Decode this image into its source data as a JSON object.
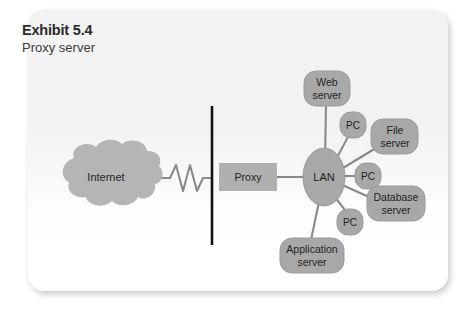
{
  "exhibit": {
    "title": "Exhibit 5.4",
    "subtitle": "Proxy server"
  },
  "colors": {
    "card_background": "#f2f2f2",
    "node_fill": "#a8a8a8",
    "node_stroke": "#8f8f8f",
    "cloud_fill": "#b5b5b5",
    "proxy_fill": "#b0b0b0",
    "connector": "#8a8a8a",
    "firewall": "#111111",
    "label_text": "#1f1f1f",
    "title_text": "#2b2b2b"
  },
  "diagram": {
    "type": "network-topology",
    "internet": {
      "label": "Internet",
      "shape": "cloud"
    },
    "firewall": {
      "label": "",
      "shape": "vertical-line"
    },
    "proxy": {
      "label": "Proxy",
      "shape": "rectangle"
    },
    "lan": {
      "label": "LAN",
      "shape": "ellipse"
    },
    "nodes": [
      {
        "id": "web-server",
        "label_line1": "Web",
        "label_line2": "server",
        "shape": "rounded-rect"
      },
      {
        "id": "pc-1",
        "label_line1": "PC",
        "label_line2": "",
        "shape": "rounded-rect"
      },
      {
        "id": "file-server",
        "label_line1": "File",
        "label_line2": "server",
        "shape": "rounded-rect"
      },
      {
        "id": "pc-2",
        "label_line1": "PC",
        "label_line2": "",
        "shape": "rounded-rect"
      },
      {
        "id": "database-server",
        "label_line1": "Database",
        "label_line2": "server",
        "shape": "rounded-rect"
      },
      {
        "id": "pc-3",
        "label_line1": "PC",
        "label_line2": "",
        "shape": "rounded-rect"
      },
      {
        "id": "application-server",
        "label_line1": "Application",
        "label_line2": "server",
        "shape": "rounded-rect"
      }
    ],
    "connections": [
      {
        "from": "internet",
        "to": "firewall",
        "style": "zigzag"
      },
      {
        "from": "proxy",
        "to": "lan",
        "style": "line"
      },
      {
        "from": "lan",
        "to": "web-server",
        "style": "line"
      },
      {
        "from": "lan",
        "to": "pc-1",
        "style": "line"
      },
      {
        "from": "lan",
        "to": "file-server",
        "style": "line"
      },
      {
        "from": "lan",
        "to": "pc-2",
        "style": "line"
      },
      {
        "from": "lan",
        "to": "database-server",
        "style": "line"
      },
      {
        "from": "lan",
        "to": "pc-3",
        "style": "line"
      },
      {
        "from": "lan",
        "to": "application-server",
        "style": "line"
      }
    ]
  }
}
